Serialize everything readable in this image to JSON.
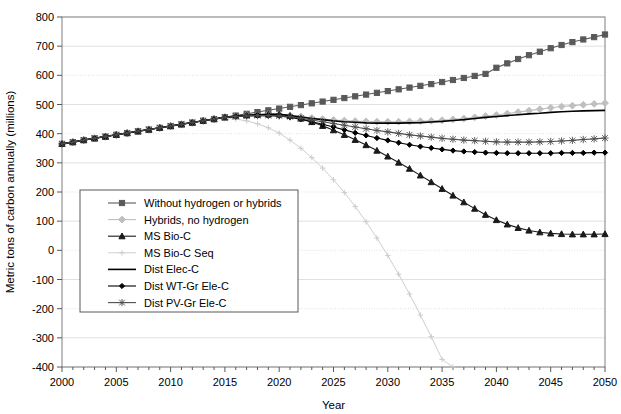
{
  "chart_data": {
    "type": "line",
    "title": "",
    "xlabel": "Year",
    "ylabel": "Metric tons of carbon annually (millions)",
    "xlim": [
      2000,
      2050
    ],
    "ylim": [
      -400,
      800
    ],
    "xticks": [
      2000,
      2005,
      2010,
      2015,
      2020,
      2025,
      2030,
      2035,
      2040,
      2045,
      2050
    ],
    "xtick_labels": [
      "2000",
      "2005",
      "2010",
      "2015",
      "2020",
      "2025",
      "2030",
      "2035",
      "2040",
      "2045",
      "2050"
    ],
    "yticks": [
      -400,
      -300,
      -200,
      -100,
      0,
      100,
      200,
      300,
      400,
      500,
      600,
      700,
      800
    ],
    "ytick_labels": [
      "-400",
      "-300",
      "-200",
      "-100",
      "0",
      "100",
      "200",
      "300",
      "400",
      "500",
      "600",
      "700",
      "800"
    ],
    "minor_xtick_interval": 1,
    "grid": true,
    "grid_axis": "y",
    "legend_position": "inner-left",
    "x": [
      2000,
      2001,
      2002,
      2003,
      2004,
      2005,
      2006,
      2007,
      2008,
      2009,
      2010,
      2011,
      2012,
      2013,
      2014,
      2015,
      2016,
      2017,
      2018,
      2019,
      2020,
      2021,
      2022,
      2023,
      2024,
      2025,
      2026,
      2027,
      2028,
      2029,
      2030,
      2031,
      2032,
      2033,
      2034,
      2035,
      2036,
      2037,
      2038,
      2039,
      2040,
      2041,
      2042,
      2043,
      2044,
      2045,
      2046,
      2047,
      2048,
      2049,
      2050
    ],
    "series": [
      {
        "name": "Without hydrogen or hybrids",
        "marker": "square",
        "color": "#595959",
        "line_style": "solid",
        "values": [
          365,
          371,
          378,
          384,
          390,
          396,
          402,
          408,
          414,
          420,
          426,
          432,
          438,
          444,
          450,
          456,
          462,
          468,
          474,
          480,
          486,
          492,
          498,
          504,
          510,
          516,
          522,
          528,
          534,
          540,
          546,
          552,
          558,
          564,
          570,
          577,
          584,
          591,
          598,
          605,
          626,
          641,
          656,
          669,
          681,
          693,
          704,
          714,
          723,
          731,
          740
        ]
      },
      {
        "name": "Hybrids, no hydrogen",
        "marker": "diamond",
        "color": "#bfbfbf",
        "line_style": "solid",
        "values": [
          365,
          371,
          378,
          384,
          390,
          396,
          402,
          408,
          414,
          420,
          426,
          432,
          438,
          444,
          450,
          456,
          460,
          463,
          465,
          466,
          466,
          463,
          459,
          454,
          450,
          447,
          445,
          443,
          442,
          441,
          441,
          441,
          442,
          443,
          444,
          446,
          449,
          452,
          456,
          460,
          464,
          469,
          474,
          479,
          484,
          489,
          493,
          496,
          499,
          502,
          505
        ]
      },
      {
        "name": "MS Bio-C",
        "marker": "triangle",
        "color": "#1a1a1a",
        "line_style": "solid",
        "values": [
          365,
          371,
          378,
          384,
          390,
          396,
          402,
          408,
          414,
          420,
          426,
          432,
          438,
          444,
          450,
          456,
          460,
          463,
          465,
          466,
          466,
          461,
          452,
          440,
          427,
          412,
          396,
          379,
          361,
          342,
          322,
          301,
          280,
          257,
          234,
          211,
          188,
          165,
          143,
          122,
          104,
          89,
          77,
          68,
          62,
          58,
          56,
          55,
          55,
          55,
          56
        ]
      },
      {
        "name": "MS Bio-C Seq",
        "marker": "plus",
        "color": "#c8c8c8",
        "line_style": "solid",
        "values": [
          365,
          371,
          378,
          384,
          390,
          396,
          402,
          408,
          414,
          420,
          426,
          432,
          438,
          444,
          450,
          452,
          450,
          444,
          434,
          420,
          402,
          378,
          350,
          318,
          282,
          242,
          198,
          150,
          98,
          42,
          -18,
          -82,
          -150,
          -222,
          -296,
          -374,
          -400,
          null,
          null,
          null,
          null,
          null,
          null,
          null,
          null,
          null,
          null,
          null,
          null,
          null,
          null
        ]
      },
      {
        "name": "Dist Elec-C",
        "marker": "none",
        "color": "#000000",
        "line_style": "solid",
        "values": [
          365,
          371,
          378,
          384,
          390,
          396,
          402,
          408,
          414,
          420,
          426,
          432,
          438,
          444,
          450,
          456,
          460,
          463,
          465,
          466,
          466,
          462,
          457,
          452,
          448,
          444,
          441,
          439,
          437,
          436,
          436,
          436,
          437,
          438,
          440,
          442,
          445,
          448,
          452,
          456,
          459,
          462,
          465,
          468,
          470,
          473,
          475,
          477,
          478,
          479,
          480
        ]
      },
      {
        "name": "Dist WT-Gr Ele-C",
        "marker": "smalldiamond",
        "color": "#000000",
        "line_style": "solid",
        "values": [
          365,
          371,
          378,
          384,
          390,
          396,
          402,
          408,
          414,
          420,
          426,
          432,
          438,
          444,
          450,
          456,
          459,
          461,
          462,
          462,
          461,
          456,
          449,
          441,
          432,
          423,
          413,
          403,
          394,
          385,
          377,
          369,
          362,
          356,
          351,
          346,
          342,
          339,
          337,
          335,
          334,
          333,
          333,
          333,
          333,
          333,
          334,
          334,
          334,
          335,
          335
        ]
      },
      {
        "name": "Dist PV-Gr Ele-C",
        "marker": "star",
        "color": "#4d4d4d",
        "line_style": "solid",
        "values": [
          365,
          371,
          378,
          384,
          390,
          396,
          402,
          408,
          414,
          420,
          426,
          432,
          438,
          444,
          450,
          456,
          459,
          461,
          462,
          462,
          461,
          458,
          453,
          447,
          441,
          435,
          429,
          423,
          417,
          411,
          406,
          401,
          396,
          392,
          388,
          384,
          381,
          378,
          376,
          374,
          372,
          371,
          371,
          371,
          372,
          373,
          375,
          377,
          380,
          382,
          385
        ]
      }
    ]
  },
  "legend": {
    "items": [
      {
        "label": "Without hydrogen or hybrids"
      },
      {
        "label": "Hybrids, no hydrogen"
      },
      {
        "label": "MS Bio-C"
      },
      {
        "label": "MS Bio-C Seq"
      },
      {
        "label": "Dist Elec-C"
      },
      {
        "label": "Dist WT-Gr Ele-C"
      },
      {
        "label": "Dist PV-Gr Ele-C"
      }
    ]
  },
  "colors": {
    "plot_border": "#7f7f7f",
    "gridline": "#d9d9d9",
    "axis": "#595959",
    "background": "#ffffff",
    "legend_border": "#595959"
  }
}
